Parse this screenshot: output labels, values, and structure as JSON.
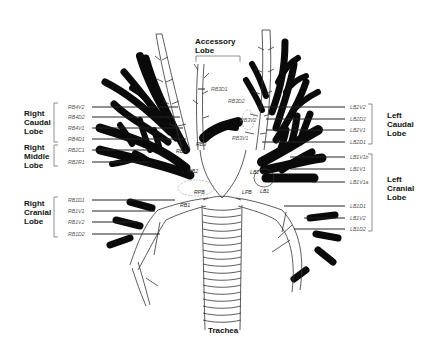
{
  "diagram": {
    "title_labels": {
      "accessory": [
        "Accessory",
        "Lobe"
      ],
      "trachea": "Trachea"
    },
    "lobes": {
      "right_caudal": [
        "Right",
        "Caudal",
        "Lobe"
      ],
      "right_middle": [
        "Right",
        "Middle",
        "Lobe"
      ],
      "right_cranial": [
        "Right",
        "Cranial",
        "Lobe"
      ],
      "left_caudal": [
        "Left",
        "Caudal",
        "Lobe"
      ],
      "left_cranial": [
        "Left",
        "Cranial",
        "Lobe"
      ]
    },
    "segments": {
      "right_caudal": [
        "RB4V2",
        "RB4D2",
        "RB4V1",
        "RB4D1"
      ],
      "right_middle": [
        "RB2C1",
        "RB2R1"
      ],
      "right_cranial": [
        "RB1D1",
        "RB1V1",
        "RB1V2",
        "RB1D2"
      ],
      "left_caudal": [
        "LB2V2",
        "LB2D2",
        "LB2V1",
        "LB2D1"
      ],
      "left_cranial": [
        "LB1V1b",
        "LB1V1",
        "LB1V1a",
        "LB1D1",
        "LB1V2",
        "LB1D2"
      ],
      "accessory": [
        "RB3D1",
        "RB3D2",
        "RB3V2",
        "RB3V1"
      ]
    },
    "inner_labels": {
      "rb3": "RB3",
      "rb4": "RB4",
      "rb2": "RB2",
      "rpb": "RPB",
      "rb1": "RB1",
      "lpb": "LPB",
      "lb1": "LB1",
      "lb2": "LB2"
    }
  }
}
